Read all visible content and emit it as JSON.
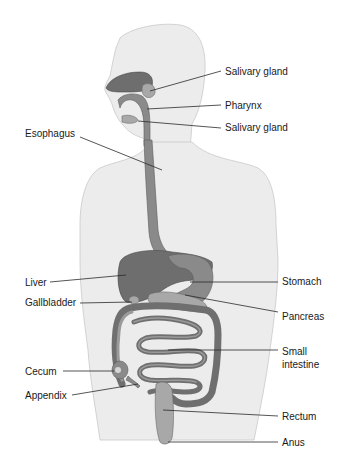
{
  "diagram": {
    "labels": {
      "salivary_gland_upper": "Salivary gland",
      "pharynx": "Pharynx",
      "salivary_gland_lower": "Salivary gland",
      "esophagus": "Esophagus",
      "liver": "Liver",
      "gallbladder": "Gallbladder",
      "stomach": "Stomach",
      "pancreas": "Pancreas",
      "small_intestine_line1": "Small",
      "small_intestine_line2": "intestine",
      "cecum": "Cecum",
      "appendix": "Appendix",
      "rectum": "Rectum",
      "anus": "Anus"
    },
    "colors": {
      "background": "#ffffff",
      "body_fill": "#ececec",
      "organ_dark": "#6e6e6e",
      "label_text": "#1a1a1a"
    }
  }
}
